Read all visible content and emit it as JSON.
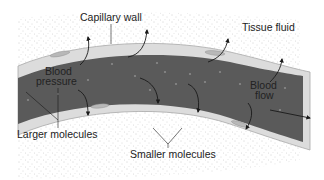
{
  "diagram": {
    "labels": {
      "capillary_wall": "Capillary wall",
      "tissue_fluid": "Tissue fluid",
      "blood_pressure_line1": "Blood",
      "blood_pressure_line2": "pressure",
      "blood_flow_line1": "Blood",
      "blood_flow_line2": "flow",
      "larger_molecules": "Larger molecules",
      "smaller_molecules": "Smaller molecules"
    },
    "colors": {
      "background": "#ffffff",
      "tissue_stipple": "#9a9a9a",
      "wall": "#dcdcdc",
      "wall_edge": "#a8a8a8",
      "blood": "#5a5a5a",
      "blood_dot": "#8a8a8a",
      "arrow": "#1a1a1a"
    }
  }
}
